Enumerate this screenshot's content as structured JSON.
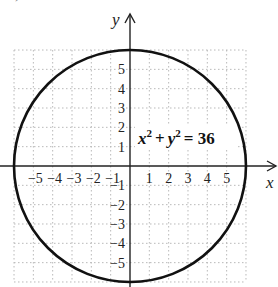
{
  "header": {
    "partial_label": "c) Circle"
  },
  "chart_data": {
    "type": "line",
    "title": "",
    "equation": "x² + y² = 36",
    "equation_parts": {
      "x": "x",
      "y": "y",
      "exp": "2",
      "plus": "+",
      "eq": "= 36"
    },
    "xlabel": "x",
    "ylabel": "y",
    "xlim": [
      -6,
      6
    ],
    "ylim": [
      -6,
      6
    ],
    "grid": true,
    "x_ticks": [
      -5,
      -4,
      -3,
      -2,
      -1,
      1,
      2,
      3,
      4,
      5
    ],
    "y_ticks": [
      5,
      4,
      3,
      2,
      1,
      -1,
      -2,
      -3,
      -4,
      -5
    ],
    "x_tick_labels": [
      "−5",
      "−4",
      "−3",
      "−2",
      "−1",
      "1",
      "2",
      "3",
      "4",
      "5"
    ],
    "y_tick_labels": [
      "5",
      "4",
      "3",
      "2",
      "1",
      "−1",
      "−2",
      "−3",
      "−4",
      "−5"
    ],
    "series": [
      {
        "name": "circle",
        "shape": "circle",
        "center": [
          0,
          0
        ],
        "radius": 6
      }
    ],
    "colors": {
      "curve": "#111111",
      "axis": "#222222",
      "grid": "#b8b8b8",
      "text": "#222222"
    }
  }
}
